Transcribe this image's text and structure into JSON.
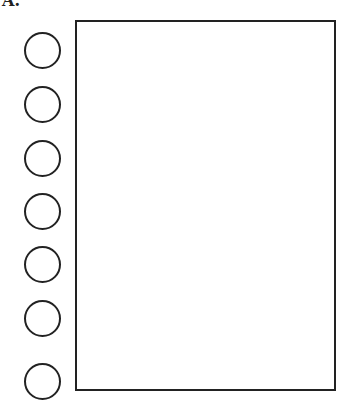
{
  "label": "A.",
  "diagram": {
    "circles": [
      {
        "top": 32
      },
      {
        "top": 86
      },
      {
        "top": 140
      },
      {
        "top": 193
      },
      {
        "top": 246
      },
      {
        "top": 300
      },
      {
        "top": 363
      }
    ],
    "rectangle": {
      "present": true
    }
  }
}
